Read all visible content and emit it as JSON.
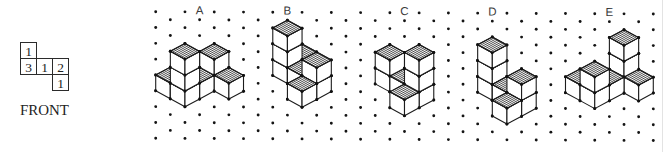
{
  "top_view": {
    "cells": [
      {
        "row": 0,
        "col": 0,
        "value": "1"
      },
      {
        "row": 1,
        "col": 0,
        "value": "3"
      },
      {
        "row": 1,
        "col": 1,
        "value": "1"
      },
      {
        "row": 1,
        "col": 2,
        "value": "2"
      },
      {
        "row": 2,
        "col": 2,
        "value": "1"
      }
    ],
    "caption": "FRONT"
  },
  "options": [
    {
      "label": "A",
      "stacks": [
        {
          "x": 0,
          "y": 0,
          "height": 1
        },
        {
          "x": 1,
          "y": 0,
          "height": 3
        },
        {
          "x": 1,
          "y": -1,
          "height": 1
        },
        {
          "x": 1,
          "y": -2,
          "height": 2
        },
        {
          "x": 2,
          "y": -2,
          "height": 1
        }
      ]
    },
    {
      "label": "B",
      "stacks": [
        {
          "x": 0,
          "y": 0,
          "height": 1
        },
        {
          "x": 0,
          "y": 1,
          "height": 3
        },
        {
          "x": 1,
          "y": 1,
          "height": 1
        },
        {
          "x": 2,
          "y": 1,
          "height": 2
        },
        {
          "x": 2,
          "y": 2,
          "height": 1
        }
      ]
    },
    {
      "label": "C",
      "stacks": [
        {
          "x": 0,
          "y": 0,
          "height": 1
        },
        {
          "x": 0,
          "y": -1,
          "height": 3
        },
        {
          "x": -1,
          "y": -1,
          "height": 1
        },
        {
          "x": -2,
          "y": -1,
          "height": 2
        },
        {
          "x": -2,
          "y": -2,
          "height": 1
        }
      ]
    },
    {
      "label": "D",
      "stacks": [
        {
          "x": 0,
          "y": 1,
          "height": 3
        },
        {
          "x": 1,
          "y": 1,
          "height": 1
        },
        {
          "x": 2,
          "y": 1,
          "height": 2
        },
        {
          "x": 2,
          "y": 2,
          "height": 1
        }
      ]
    },
    {
      "label": "E",
      "stacks": [
        {
          "x": 0,
          "y": 0,
          "height": 1
        },
        {
          "x": -1,
          "y": 0,
          "height": 3
        },
        {
          "x": -1,
          "y": 1,
          "height": 1
        },
        {
          "x": -1,
          "y": 2,
          "height": 2
        },
        {
          "x": -2,
          "y": 2,
          "height": 1
        }
      ]
    }
  ],
  "colors": {
    "ink": "#1c1c1c",
    "face": "#ffffff",
    "border": "#e3e3e3"
  }
}
